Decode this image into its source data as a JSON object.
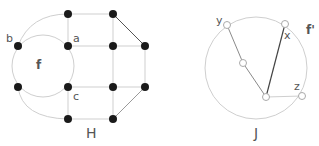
{
  "graphs": [
    {
      "id": "H",
      "caption": "H",
      "vertex_style": "filled",
      "vertices": [
        {
          "id": "top",
          "x": 68,
          "y": 14,
          "label": ""
        },
        {
          "id": "a",
          "x": 68,
          "y": 46,
          "label": "a"
        },
        {
          "id": "b",
          "x": 18,
          "y": 46,
          "label": "b"
        },
        {
          "id": "lb",
          "x": 18,
          "y": 87,
          "label": ""
        },
        {
          "id": "c",
          "x": 68,
          "y": 87,
          "label": "c"
        },
        {
          "id": "bottom",
          "x": 68,
          "y": 119,
          "label": ""
        },
        {
          "id": "r1",
          "x": 113,
          "y": 14,
          "label": ""
        },
        {
          "id": "r2",
          "x": 113,
          "y": 46,
          "label": ""
        },
        {
          "id": "r3",
          "x": 145,
          "y": 46,
          "label": ""
        },
        {
          "id": "r4",
          "x": 113,
          "y": 87,
          "label": ""
        },
        {
          "id": "r5",
          "x": 145,
          "y": 87,
          "label": ""
        },
        {
          "id": "r6",
          "x": 113,
          "y": 119,
          "label": ""
        }
      ],
      "face_label": "f"
    },
    {
      "id": "J",
      "caption": "J",
      "vertex_style": "hollow",
      "vertices": [
        {
          "id": "y",
          "x": 227,
          "y": 25,
          "label": "y"
        },
        {
          "id": "x",
          "x": 285,
          "y": 24,
          "label": "x"
        },
        {
          "id": "m",
          "x": 243,
          "y": 63,
          "label": ""
        },
        {
          "id": "center",
          "x": 266,
          "y": 97,
          "label": ""
        },
        {
          "id": "z",
          "x": 302,
          "y": 96,
          "label": "z"
        }
      ],
      "face_label": "f'"
    }
  ],
  "colors": {
    "edge_light": "#c8c8c8",
    "edge_mid": "#8a8a8a",
    "edge_dark": "#444444",
    "vertex_fill": "#1a1a1a",
    "label": "#555555"
  }
}
